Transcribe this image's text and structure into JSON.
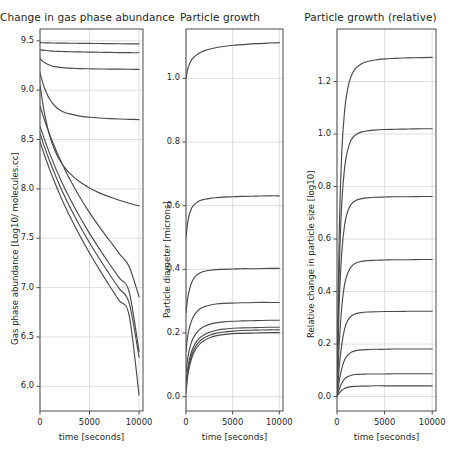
{
  "figure": {
    "background": "#ffffff",
    "line_color": "#4a4a4a",
    "grid_color": "#d6d6d6",
    "axis_color": "#4d4d4d",
    "width": 451,
    "height": 470
  },
  "chart_data": [
    {
      "type": "line",
      "panel_index": 1,
      "title": "Change in gas phase abundance",
      "xlabel": "time [seconds]",
      "ylabel": "Gas phase abundance [Log10/ molecules.cc]",
      "xlim": [
        0,
        10400
      ],
      "ylim": [
        5.75,
        9.62
      ],
      "xticks": [
        0,
        5000,
        10000
      ],
      "xticklabels": [
        "0",
        "5000",
        "10000"
      ],
      "yticks": [
        6.0,
        6.5,
        7.0,
        7.5,
        8.0,
        8.5,
        9.0,
        9.5
      ],
      "yticklabels": [
        "6.0",
        "6.5",
        "7.0",
        "7.5",
        "8.0",
        "8.5",
        "9.0",
        "9.5"
      ],
      "grid": true,
      "legend": "none",
      "x": [
        0,
        250,
        500,
        1000,
        1500,
        2000,
        2500,
        3000,
        4000,
        5000,
        6000,
        7000,
        8000,
        9000,
        10000
      ],
      "series": [
        {
          "name": "curve-1",
          "values": [
            9.482,
            9.481,
            9.48,
            9.479,
            9.478,
            9.477,
            9.477,
            9.476,
            9.475,
            9.474,
            9.473,
            9.472,
            9.471,
            9.47,
            9.469
          ]
        },
        {
          "name": "curve-2",
          "values": [
            9.41,
            9.406,
            9.403,
            9.398,
            9.395,
            9.393,
            9.391,
            9.39,
            9.388,
            9.386,
            9.384,
            9.383,
            9.381,
            9.38,
            9.379
          ]
        },
        {
          "name": "curve-3",
          "values": [
            9.32,
            9.297,
            9.278,
            9.253,
            9.239,
            9.231,
            9.226,
            9.223,
            9.219,
            9.217,
            9.215,
            9.214,
            9.213,
            9.212,
            9.211
          ]
        },
        {
          "name": "curve-4",
          "values": [
            9.175,
            9.085,
            9.01,
            8.905,
            8.84,
            8.8,
            8.775,
            8.76,
            8.738,
            8.726,
            8.718,
            8.712,
            8.708,
            8.705,
            8.702
          ]
        },
        {
          "name": "curve-5",
          "values": [
            9.055,
            8.885,
            8.74,
            8.53,
            8.39,
            8.29,
            8.215,
            8.158,
            8.072,
            8.01,
            7.96,
            7.92,
            7.885,
            7.855,
            7.828
          ]
        },
        {
          "name": "curve-6",
          "values": [
            8.84,
            8.76,
            8.685,
            8.545,
            8.42,
            8.305,
            8.2,
            8.1,
            7.92,
            7.76,
            7.615,
            7.48,
            7.345,
            7.215,
            6.905
          ]
        },
        {
          "name": "curve-7",
          "values": [
            8.635,
            8.56,
            8.488,
            8.352,
            8.228,
            8.112,
            8.005,
            7.905,
            7.72,
            7.55,
            7.392,
            7.242,
            7.098,
            6.958,
            6.352
          ]
        },
        {
          "name": "curve-8",
          "values": [
            8.56,
            8.485,
            8.412,
            8.275,
            8.15,
            8.032,
            7.922,
            7.82,
            7.63,
            7.455,
            7.292,
            7.138,
            6.99,
            6.845,
            6.295
          ]
        },
        {
          "name": "curve-9",
          "values": [
            8.478,
            8.402,
            8.328,
            8.19,
            8.062,
            7.942,
            7.83,
            7.725,
            7.53,
            7.35,
            7.182,
            7.022,
            6.868,
            6.718,
            5.91
          ]
        }
      ]
    },
    {
      "type": "line",
      "panel_index": 2,
      "title": "Particle growth",
      "xlabel": "time [seconds]",
      "ylabel": "Particle diameter [microns]",
      "xlim": [
        0,
        10400
      ],
      "ylim": [
        -0.045,
        1.155
      ],
      "xticks": [
        0,
        5000,
        10000
      ],
      "xticklabels": [
        "0",
        "5000",
        "10000"
      ],
      "yticks": [
        0.0,
        0.2,
        0.4,
        0.6,
        0.8,
        1.0
      ],
      "yticklabels": [
        "0.0",
        "0.2",
        "0.4",
        "0.6",
        "0.8",
        "1.0"
      ],
      "grid": true,
      "legend": "none",
      "x": [
        0,
        150,
        300,
        600,
        900,
        1200,
        1600,
        2000,
        2600,
        3200,
        4000,
        5000,
        6000,
        7500,
        9000,
        10000
      ],
      "series": [
        {
          "name": "curve-1",
          "values": [
            1.0,
            1.024,
            1.04,
            1.058,
            1.068,
            1.075,
            1.082,
            1.087,
            1.092,
            1.096,
            1.1,
            1.104,
            1.106,
            1.109,
            1.111,
            1.112
          ]
        },
        {
          "name": "curve-2",
          "values": [
            0.5,
            0.54,
            0.566,
            0.592,
            0.604,
            0.611,
            0.617,
            0.62,
            0.623,
            0.625,
            0.627,
            0.628,
            0.629,
            0.63,
            0.631,
            0.631
          ]
        },
        {
          "name": "curve-3",
          "values": [
            0.265,
            0.302,
            0.328,
            0.358,
            0.374,
            0.383,
            0.39,
            0.394,
            0.397,
            0.399,
            0.4,
            0.401,
            0.402,
            0.402,
            0.403,
            0.403
          ]
        },
        {
          "name": "curve-4",
          "values": [
            0.143,
            0.182,
            0.208,
            0.239,
            0.257,
            0.268,
            0.278,
            0.283,
            0.288,
            0.291,
            0.293,
            0.294,
            0.295,
            0.296,
            0.296,
            0.296
          ]
        },
        {
          "name": "curve-5",
          "values": [
            0.078,
            0.114,
            0.14,
            0.172,
            0.191,
            0.203,
            0.214,
            0.221,
            0.228,
            0.232,
            0.235,
            0.237,
            0.238,
            0.239,
            0.24,
            0.24
          ]
        },
        {
          "name": "curve-6",
          "values": [
            0.042,
            0.082,
            0.108,
            0.142,
            0.162,
            0.176,
            0.188,
            0.195,
            0.203,
            0.208,
            0.212,
            0.215,
            0.216,
            0.217,
            0.218,
            0.218
          ]
        },
        {
          "name": "curve-7",
          "values": [
            0.025,
            0.068,
            0.096,
            0.13,
            0.151,
            0.165,
            0.178,
            0.186,
            0.194,
            0.199,
            0.203,
            0.206,
            0.208,
            0.209,
            0.21,
            0.21
          ]
        },
        {
          "name": "curve-8",
          "values": [
            0.012,
            0.056,
            0.085,
            0.12,
            0.142,
            0.156,
            0.169,
            0.177,
            0.186,
            0.191,
            0.195,
            0.198,
            0.199,
            0.2,
            0.201,
            0.201
          ]
        }
      ]
    },
    {
      "type": "line",
      "panel_index": 3,
      "title": "Particle growth (relative)",
      "xlabel": "time [seconds]",
      "ylabel": "Relative change in particle size [log10]",
      "xlim": [
        0,
        10400
      ],
      "ylim": [
        -0.055,
        1.4
      ],
      "xticks": [
        0,
        5000,
        10000
      ],
      "xticklabels": [
        "0",
        "5000",
        "10000"
      ],
      "yticks": [
        0.0,
        0.2,
        0.4,
        0.6,
        0.8,
        1.0,
        1.2
      ],
      "yticklabels": [
        "0.0",
        "0.2",
        "0.4",
        "0.6",
        "0.8",
        "1.0",
        "1.2"
      ],
      "grid": true,
      "legend": "none",
      "x": [
        0,
        100,
        250,
        500,
        800,
        1100,
        1500,
        2000,
        2600,
        3200,
        4000,
        5000,
        6000,
        7500,
        9000,
        10000
      ],
      "series": [
        {
          "name": "curve-1",
          "values": [
            0.01,
            0.3,
            0.64,
            0.93,
            1.09,
            1.168,
            1.222,
            1.252,
            1.268,
            1.276,
            1.282,
            1.286,
            1.288,
            1.29,
            1.291,
            1.292
          ]
        },
        {
          "name": "curve-2",
          "values": [
            0.01,
            0.232,
            0.5,
            0.735,
            0.872,
            0.936,
            0.978,
            0.998,
            1.008,
            1.012,
            1.015,
            1.017,
            1.018,
            1.019,
            1.02,
            1.02
          ]
        },
        {
          "name": "curve-3",
          "values": [
            0.01,
            0.168,
            0.37,
            0.548,
            0.655,
            0.703,
            0.733,
            0.748,
            0.754,
            0.757,
            0.759,
            0.76,
            0.761,
            0.761,
            0.762,
            0.762
          ]
        },
        {
          "name": "curve-4",
          "values": [
            0.008,
            0.092,
            0.212,
            0.34,
            0.427,
            0.468,
            0.495,
            0.509,
            0.515,
            0.518,
            0.519,
            0.52,
            0.521,
            0.521,
            0.522,
            0.522
          ]
        },
        {
          "name": "curve-5",
          "values": [
            0.006,
            0.048,
            0.118,
            0.198,
            0.258,
            0.288,
            0.307,
            0.316,
            0.32,
            0.322,
            0.323,
            0.324,
            0.324,
            0.325,
            0.325,
            0.325
          ]
        },
        {
          "name": "curve-6",
          "values": [
            0.004,
            0.024,
            0.062,
            0.106,
            0.14,
            0.157,
            0.169,
            0.175,
            0.178,
            0.179,
            0.18,
            0.18,
            0.181,
            0.181,
            0.181,
            0.181
          ]
        },
        {
          "name": "curve-7",
          "values": [
            0.003,
            0.012,
            0.03,
            0.051,
            0.067,
            0.075,
            0.081,
            0.084,
            0.085,
            0.086,
            0.086,
            0.086,
            0.087,
            0.087,
            0.087,
            0.087
          ]
        },
        {
          "name": "curve-8",
          "values": [
            0.002,
            0.006,
            0.014,
            0.024,
            0.031,
            0.035,
            0.038,
            0.039,
            0.04,
            0.04,
            0.041,
            0.041,
            0.041,
            0.041,
            0.041,
            0.041
          ]
        }
      ]
    }
  ]
}
